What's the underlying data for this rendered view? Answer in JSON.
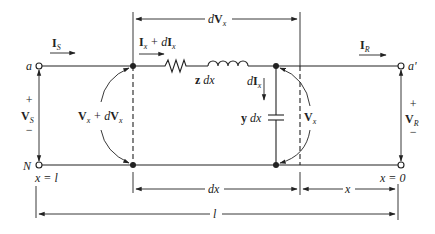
{
  "diagram": {
    "labels": {
      "node_a": "a",
      "node_a_prime": "a'",
      "node_N": "N",
      "current_source": "I",
      "current_source_sub": "S",
      "current_receiving": "I",
      "current_receiving_sub": "R",
      "current_x": "I",
      "current_x_sub": "x",
      "current_x_plus": " + d",
      "current_x_bold2": "I",
      "current_x_sub2": "x",
      "voltage_source": "V",
      "voltage_source_sub": "S",
      "voltage_receiving": "V",
      "voltage_receiving_sub": "R",
      "voltage_x": "V",
      "voltage_x_sub": "x",
      "voltage_x_dvx_plus": " + d",
      "dVx_top": "d",
      "dIx_shunt": "d",
      "series_impedance": "z",
      "series_impedance_dx": " dx",
      "shunt_admittance": "y",
      "shunt_admittance_dx": " dx",
      "plus": "+",
      "minus": "−",
      "x_equals_l": "x = l",
      "x_equals_0": "x = 0",
      "dim_dx": "dx",
      "dim_x": "x",
      "dim_l": "l"
    }
  }
}
